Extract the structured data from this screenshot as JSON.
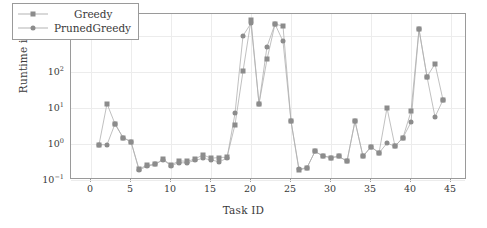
{
  "chart_data": {
    "type": "line",
    "title": "",
    "xlabel": "Task ID",
    "ylabel": "Runtime in sec",
    "yscale": "log",
    "ylim": [
      0.1,
      4000
    ],
    "xlim": [
      -2.5,
      47
    ],
    "grid": true,
    "legend_position": "top-left",
    "xticks": [
      0,
      5,
      10,
      15,
      20,
      25,
      30,
      35,
      40,
      45
    ],
    "ytick_labels": [
      "10-1",
      "100",
      "101",
      "102",
      "103"
    ],
    "yticks": [
      0.1,
      1,
      10,
      100,
      1000
    ],
    "x": [
      1,
      2,
      3,
      4,
      5,
      6,
      7,
      8,
      9,
      10,
      11,
      12,
      13,
      14,
      15,
      16,
      17,
      18,
      19,
      20,
      21,
      22,
      23,
      24,
      25,
      26,
      27,
      28,
      29,
      30,
      31,
      32,
      33,
      34,
      35,
      36,
      37,
      38,
      39,
      40,
      41,
      42,
      43,
      44
    ],
    "series": [
      {
        "name": "Greedy",
        "marker": "square",
        "color": "#8c8c8c",
        "values": [
          0.95,
          13.0,
          3.6,
          1.5,
          1.15,
          0.2,
          0.26,
          0.27,
          0.38,
          0.26,
          0.34,
          0.33,
          0.38,
          0.5,
          0.4,
          0.42,
          0.43,
          3.4,
          103.0,
          2700.0,
          13.0,
          220.0,
          2100.0,
          1850.0,
          4.3,
          0.185,
          0.22,
          0.62,
          0.46,
          0.42,
          0.45,
          0.33,
          4.3,
          0.45,
          0.84,
          0.56,
          10.0,
          0.86,
          1.5,
          8.0,
          1500.0,
          73.0,
          165.0,
          16.5
        ]
      },
      {
        "name": "PrunedGreedy",
        "marker": "circle",
        "color": "#8c8c8c",
        "values": [
          0.95,
          0.95,
          3.6,
          1.5,
          1.15,
          0.19,
          0.24,
          0.27,
          0.36,
          0.25,
          0.3,
          0.3,
          0.35,
          0.4,
          0.36,
          0.32,
          0.4,
          7.0,
          1000.0,
          2200.0,
          13.0,
          500.0,
          2100.0,
          700.0,
          4.3,
          0.2,
          0.22,
          0.62,
          0.46,
          0.42,
          0.45,
          0.33,
          4.3,
          0.45,
          0.84,
          0.56,
          1.05,
          0.86,
          1.5,
          4.0,
          1500.0,
          73.0,
          5.6,
          16.5
        ]
      }
    ]
  },
  "legend": {
    "items": [
      {
        "label": "Greedy",
        "marker": "square"
      },
      {
        "label": "PrunedGreedy",
        "marker": "circle"
      }
    ]
  },
  "axis": {
    "x_title": "Task ID",
    "y_title": "Runtime in sec"
  }
}
